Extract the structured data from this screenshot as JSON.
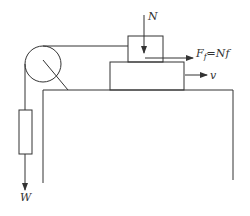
{
  "diagram": {
    "labels": {
      "normal_force": "N",
      "friction_force": "F",
      "friction_sub": "f",
      "friction_eq": "=Nf",
      "velocity": "v",
      "weight": "W"
    },
    "colors": {
      "stroke": "#333333",
      "background": "#ffffff"
    }
  }
}
